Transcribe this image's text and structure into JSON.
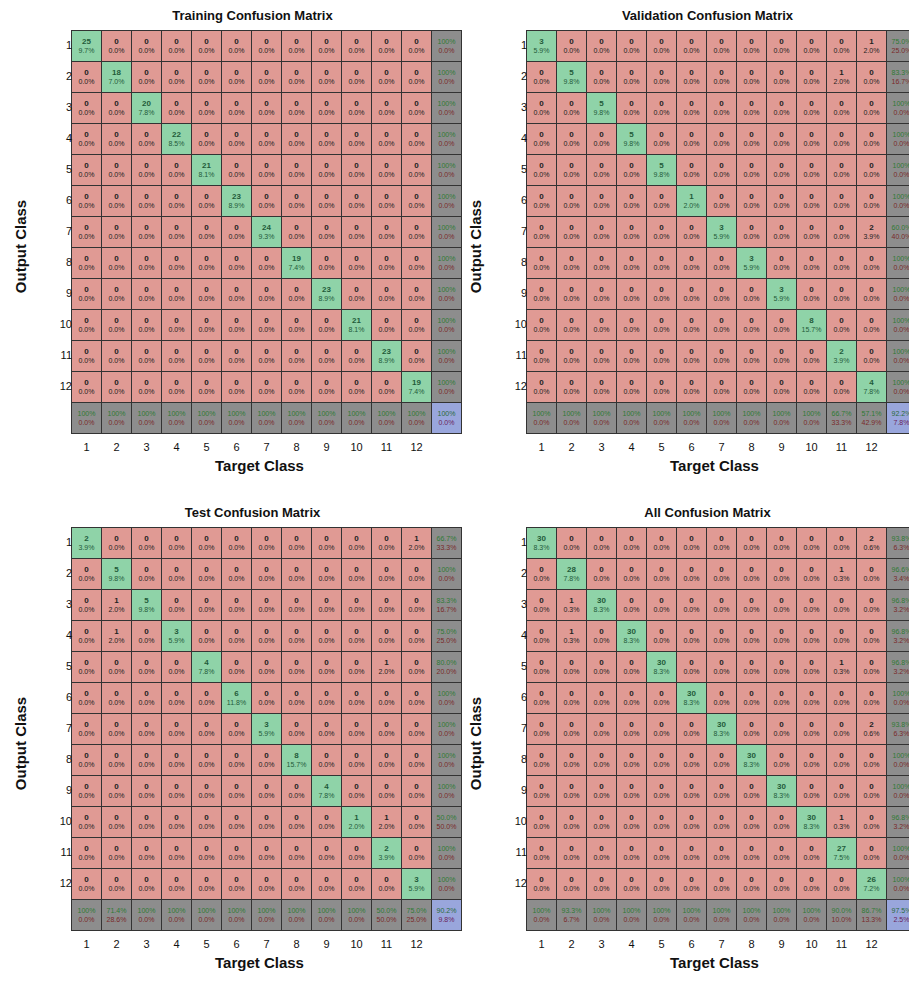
{
  "chart_data": [
    {
      "type": "heatmap",
      "title": "Training Confusion Matrix",
      "xlabel": "Target Class",
      "ylabel": "Output Class",
      "categories": [
        "1",
        "2",
        "3",
        "4",
        "5",
        "6",
        "7",
        "8",
        "9",
        "10",
        "11",
        "12"
      ],
      "counts": [
        [
          25,
          0,
          0,
          0,
          0,
          0,
          0,
          0,
          0,
          0,
          0,
          0
        ],
        [
          0,
          18,
          0,
          0,
          0,
          0,
          0,
          0,
          0,
          0,
          0,
          0
        ],
        [
          0,
          0,
          20,
          0,
          0,
          0,
          0,
          0,
          0,
          0,
          0,
          0
        ],
        [
          0,
          0,
          0,
          22,
          0,
          0,
          0,
          0,
          0,
          0,
          0,
          0
        ],
        [
          0,
          0,
          0,
          0,
          21,
          0,
          0,
          0,
          0,
          0,
          0,
          0
        ],
        [
          0,
          0,
          0,
          0,
          0,
          23,
          0,
          0,
          0,
          0,
          0,
          0
        ],
        [
          0,
          0,
          0,
          0,
          0,
          0,
          24,
          0,
          0,
          0,
          0,
          0
        ],
        [
          0,
          0,
          0,
          0,
          0,
          0,
          0,
          19,
          0,
          0,
          0,
          0
        ],
        [
          0,
          0,
          0,
          0,
          0,
          0,
          0,
          0,
          23,
          0,
          0,
          0
        ],
        [
          0,
          0,
          0,
          0,
          0,
          0,
          0,
          0,
          0,
          21,
          0,
          0
        ],
        [
          0,
          0,
          0,
          0,
          0,
          0,
          0,
          0,
          0,
          0,
          23,
          0
        ],
        [
          0,
          0,
          0,
          0,
          0,
          0,
          0,
          0,
          0,
          0,
          0,
          19
        ]
      ],
      "diag_pct": [
        "9.7%",
        "7.0%",
        "7.8%",
        "8.5%",
        "8.1%",
        "8.9%",
        "9.3%",
        "7.4%",
        "8.9%",
        "8.1%",
        "8.9%",
        "7.4%"
      ],
      "offdiag_pct": {},
      "row_summary": [
        [
          "100%",
          "0.0%"
        ],
        [
          "100%",
          "0.0%"
        ],
        [
          "100%",
          "0.0%"
        ],
        [
          "100%",
          "0.0%"
        ],
        [
          "100%",
          "0.0%"
        ],
        [
          "100%",
          "0.0%"
        ],
        [
          "100%",
          "0.0%"
        ],
        [
          "100%",
          "0.0%"
        ],
        [
          "100%",
          "0.0%"
        ],
        [
          "100%",
          "0.0%"
        ],
        [
          "100%",
          "0.0%"
        ],
        [
          "100%",
          "0.0%"
        ]
      ],
      "col_summary": [
        [
          "100%",
          "0.0%"
        ],
        [
          "100%",
          "0.0%"
        ],
        [
          "100%",
          "0.0%"
        ],
        [
          "100%",
          "0.0%"
        ],
        [
          "100%",
          "0.0%"
        ],
        [
          "100%",
          "0.0%"
        ],
        [
          "100%",
          "0.0%"
        ],
        [
          "100%",
          "0.0%"
        ],
        [
          "100%",
          "0.0%"
        ],
        [
          "100%",
          "0.0%"
        ],
        [
          "100%",
          "0.0%"
        ],
        [
          "100%",
          "0.0%"
        ]
      ],
      "overall": [
        "100%",
        "0.0%"
      ]
    },
    {
      "type": "heatmap",
      "title": "Validation Confusion Matrix",
      "xlabel": "Target Class",
      "ylabel": "Output Class",
      "categories": [
        "1",
        "2",
        "3",
        "4",
        "5",
        "6",
        "7",
        "8",
        "9",
        "10",
        "11",
        "12"
      ],
      "counts": [
        [
          3,
          0,
          0,
          0,
          0,
          0,
          0,
          0,
          0,
          0,
          0,
          1
        ],
        [
          0,
          5,
          0,
          0,
          0,
          0,
          0,
          0,
          0,
          0,
          1,
          0
        ],
        [
          0,
          0,
          5,
          0,
          0,
          0,
          0,
          0,
          0,
          0,
          0,
          0
        ],
        [
          0,
          0,
          0,
          5,
          0,
          0,
          0,
          0,
          0,
          0,
          0,
          0
        ],
        [
          0,
          0,
          0,
          0,
          5,
          0,
          0,
          0,
          0,
          0,
          0,
          0
        ],
        [
          0,
          0,
          0,
          0,
          0,
          1,
          0,
          0,
          0,
          0,
          0,
          0
        ],
        [
          0,
          0,
          0,
          0,
          0,
          0,
          3,
          0,
          0,
          0,
          0,
          2
        ],
        [
          0,
          0,
          0,
          0,
          0,
          0,
          0,
          3,
          0,
          0,
          0,
          0
        ],
        [
          0,
          0,
          0,
          0,
          0,
          0,
          0,
          0,
          3,
          0,
          0,
          0
        ],
        [
          0,
          0,
          0,
          0,
          0,
          0,
          0,
          0,
          0,
          8,
          0,
          0
        ],
        [
          0,
          0,
          0,
          0,
          0,
          0,
          0,
          0,
          0,
          0,
          2,
          0
        ],
        [
          0,
          0,
          0,
          0,
          0,
          0,
          0,
          0,
          0,
          0,
          0,
          4
        ]
      ],
      "diag_pct": [
        "5.9%",
        "9.8%",
        "9.8%",
        "9.8%",
        "9.8%",
        "2.0%",
        "5.9%",
        "5.9%",
        "5.9%",
        "15.7%",
        "3.9%",
        "7.8%"
      ],
      "offdiag_pct": {
        "0-11": "2.0%",
        "1-10": "2.0%",
        "6-11": "3.9%"
      },
      "row_summary": [
        [
          "75.0%",
          "25.0%"
        ],
        [
          "83.3%",
          "16.7%"
        ],
        [
          "100%",
          "0.0%"
        ],
        [
          "100%",
          "0.0%"
        ],
        [
          "100%",
          "0.0%"
        ],
        [
          "100%",
          "0.0%"
        ],
        [
          "60.0%",
          "40.0%"
        ],
        [
          "100%",
          "0.0%"
        ],
        [
          "100%",
          "0.0%"
        ],
        [
          "100%",
          "0.0%"
        ],
        [
          "100%",
          "0.0%"
        ],
        [
          "100%",
          "0.0%"
        ]
      ],
      "col_summary": [
        [
          "100%",
          "0.0%"
        ],
        [
          "100%",
          "0.0%"
        ],
        [
          "100%",
          "0.0%"
        ],
        [
          "100%",
          "0.0%"
        ],
        [
          "100%",
          "0.0%"
        ],
        [
          "100%",
          "0.0%"
        ],
        [
          "100%",
          "0.0%"
        ],
        [
          "100%",
          "0.0%"
        ],
        [
          "100%",
          "0.0%"
        ],
        [
          "100%",
          "0.0%"
        ],
        [
          "66.7%",
          "33.3%"
        ],
        [
          "57.1%",
          "42.9%"
        ]
      ],
      "overall": [
        "92.2%",
        "7.8%"
      ]
    },
    {
      "type": "heatmap",
      "title": "Test Confusion Matrix",
      "xlabel": "Target Class",
      "ylabel": "Output Class",
      "categories": [
        "1",
        "2",
        "3",
        "4",
        "5",
        "6",
        "7",
        "8",
        "9",
        "10",
        "11",
        "12"
      ],
      "counts": [
        [
          2,
          0,
          0,
          0,
          0,
          0,
          0,
          0,
          0,
          0,
          0,
          1
        ],
        [
          0,
          5,
          0,
          0,
          0,
          0,
          0,
          0,
          0,
          0,
          0,
          0
        ],
        [
          0,
          1,
          5,
          0,
          0,
          0,
          0,
          0,
          0,
          0,
          0,
          0
        ],
        [
          0,
          1,
          0,
          3,
          0,
          0,
          0,
          0,
          0,
          0,
          0,
          0
        ],
        [
          0,
          0,
          0,
          0,
          4,
          0,
          0,
          0,
          0,
          0,
          1,
          0
        ],
        [
          0,
          0,
          0,
          0,
          0,
          6,
          0,
          0,
          0,
          0,
          0,
          0
        ],
        [
          0,
          0,
          0,
          0,
          0,
          0,
          3,
          0,
          0,
          0,
          0,
          0
        ],
        [
          0,
          0,
          0,
          0,
          0,
          0,
          0,
          8,
          0,
          0,
          0,
          0
        ],
        [
          0,
          0,
          0,
          0,
          0,
          0,
          0,
          0,
          4,
          0,
          0,
          0
        ],
        [
          0,
          0,
          0,
          0,
          0,
          0,
          0,
          0,
          0,
          1,
          1,
          0
        ],
        [
          0,
          0,
          0,
          0,
          0,
          0,
          0,
          0,
          0,
          0,
          2,
          0
        ],
        [
          0,
          0,
          0,
          0,
          0,
          0,
          0,
          0,
          0,
          0,
          0,
          3
        ]
      ],
      "diag_pct": [
        "3.9%",
        "9.8%",
        "9.8%",
        "5.9%",
        "7.8%",
        "11.8%",
        "5.9%",
        "15.7%",
        "7.8%",
        "2.0%",
        "3.9%",
        "5.9%"
      ],
      "offdiag_pct": {
        "0-11": "2.0%",
        "2-1": "2.0%",
        "3-1": "2.0%",
        "4-10": "2.0%",
        "9-10": "2.0%"
      },
      "row_summary": [
        [
          "66.7%",
          "33.3%"
        ],
        [
          "100%",
          "0.0%"
        ],
        [
          "83.3%",
          "16.7%"
        ],
        [
          "75.0%",
          "25.0%"
        ],
        [
          "80.0%",
          "20.0%"
        ],
        [
          "100%",
          "0.0%"
        ],
        [
          "100%",
          "0.0%"
        ],
        [
          "100%",
          "0.0%"
        ],
        [
          "100%",
          "0.0%"
        ],
        [
          "50.0%",
          "50.0%"
        ],
        [
          "100%",
          "0.0%"
        ],
        [
          "100%",
          "0.0%"
        ]
      ],
      "col_summary": [
        [
          "100%",
          "0.0%"
        ],
        [
          "71.4%",
          "28.6%"
        ],
        [
          "100%",
          "0.0%"
        ],
        [
          "100%",
          "0.0%"
        ],
        [
          "100%",
          "0.0%"
        ],
        [
          "100%",
          "0.0%"
        ],
        [
          "100%",
          "0.0%"
        ],
        [
          "100%",
          "0.0%"
        ],
        [
          "100%",
          "0.0%"
        ],
        [
          "100%",
          "0.0%"
        ],
        [
          "50.0%",
          "50.0%"
        ],
        [
          "75.0%",
          "25.0%"
        ]
      ],
      "overall": [
        "90.2%",
        "9.8%"
      ]
    },
    {
      "type": "heatmap",
      "title": "All Confusion Matrix",
      "xlabel": "Target Class",
      "ylabel": "Output Class",
      "categories": [
        "1",
        "2",
        "3",
        "4",
        "5",
        "6",
        "7",
        "8",
        "9",
        "10",
        "11",
        "12"
      ],
      "counts": [
        [
          30,
          0,
          0,
          0,
          0,
          0,
          0,
          0,
          0,
          0,
          0,
          2
        ],
        [
          0,
          28,
          0,
          0,
          0,
          0,
          0,
          0,
          0,
          0,
          1,
          0
        ],
        [
          0,
          1,
          30,
          0,
          0,
          0,
          0,
          0,
          0,
          0,
          0,
          0
        ],
        [
          0,
          1,
          0,
          30,
          0,
          0,
          0,
          0,
          0,
          0,
          0,
          0
        ],
        [
          0,
          0,
          0,
          0,
          30,
          0,
          0,
          0,
          0,
          0,
          1,
          0
        ],
        [
          0,
          0,
          0,
          0,
          0,
          30,
          0,
          0,
          0,
          0,
          0,
          0
        ],
        [
          0,
          0,
          0,
          0,
          0,
          0,
          30,
          0,
          0,
          0,
          0,
          2
        ],
        [
          0,
          0,
          0,
          0,
          0,
          0,
          0,
          30,
          0,
          0,
          0,
          0
        ],
        [
          0,
          0,
          0,
          0,
          0,
          0,
          0,
          0,
          30,
          0,
          0,
          0
        ],
        [
          0,
          0,
          0,
          0,
          0,
          0,
          0,
          0,
          0,
          30,
          1,
          0
        ],
        [
          0,
          0,
          0,
          0,
          0,
          0,
          0,
          0,
          0,
          0,
          27,
          0
        ],
        [
          0,
          0,
          0,
          0,
          0,
          0,
          0,
          0,
          0,
          0,
          0,
          26
        ]
      ],
      "diag_pct": [
        "8.3%",
        "7.8%",
        "8.3%",
        "8.3%",
        "8.3%",
        "8.3%",
        "8.3%",
        "8.3%",
        "8.3%",
        "8.3%",
        "7.5%",
        "7.2%"
      ],
      "offdiag_pct": {
        "0-11": "0.6%",
        "1-10": "0.3%",
        "2-1": "0.3%",
        "3-1": "0.3%",
        "4-10": "0.3%",
        "6-11": "0.6%",
        "9-10": "0.3%"
      },
      "row_summary": [
        [
          "93.8%",
          "6.3%"
        ],
        [
          "96.6%",
          "3.4%"
        ],
        [
          "96.8%",
          "3.2%"
        ],
        [
          "96.8%",
          "3.2%"
        ],
        [
          "96.8%",
          "3.2%"
        ],
        [
          "100%",
          "0.0%"
        ],
        [
          "93.8%",
          "6.3%"
        ],
        [
          "100%",
          "0.0%"
        ],
        [
          "100%",
          "0.0%"
        ],
        [
          "96.8%",
          "3.2%"
        ],
        [
          "100%",
          "0.0%"
        ],
        [
          "100%",
          "0.0%"
        ]
      ],
      "col_summary": [
        [
          "100%",
          "0.0%"
        ],
        [
          "93.3%",
          "6.7%"
        ],
        [
          "100%",
          "0.0%"
        ],
        [
          "100%",
          "0.0%"
        ],
        [
          "100%",
          "0.0%"
        ],
        [
          "100%",
          "0.0%"
        ],
        [
          "100%",
          "0.0%"
        ],
        [
          "100%",
          "0.0%"
        ],
        [
          "100%",
          "0.0%"
        ],
        [
          "100%",
          "0.0%"
        ],
        [
          "90.0%",
          "10.0%"
        ],
        [
          "86.7%",
          "13.3%"
        ]
      ],
      "overall": [
        "97.5%",
        "2.5%"
      ]
    }
  ],
  "panels": [
    {
      "title": "Training Confusion Matrix",
      "xlabel": "Target Class",
      "ylabel": "Output Class"
    },
    {
      "title": "Validation Confusion Matrix",
      "xlabel": "Target Class",
      "ylabel": "Output Class"
    },
    {
      "title": "Test Confusion Matrix",
      "xlabel": "Target Class",
      "ylabel": "Output Class"
    },
    {
      "title": "All Confusion Matrix",
      "xlabel": "Target Class",
      "ylabel": "Output Class"
    }
  ],
  "colors": {
    "correct": "#8fd3a8",
    "incorrect": "#e09a94",
    "summary": "#8d8d8d",
    "overall": "#99a6dc"
  }
}
